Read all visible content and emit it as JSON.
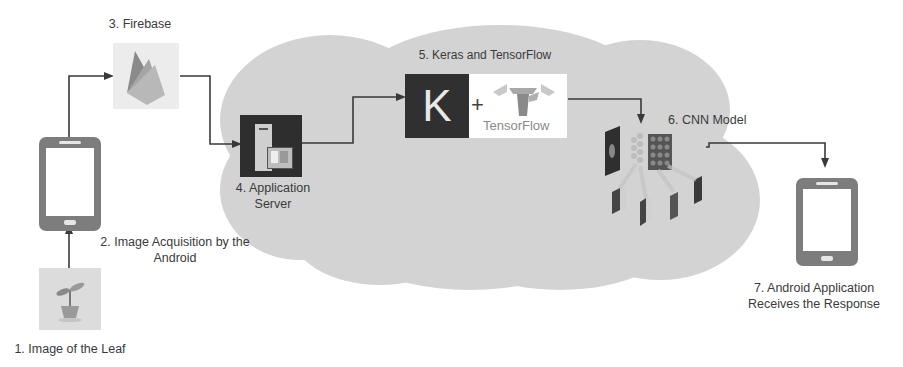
{
  "diagram": {
    "steps": [
      {
        "id": 1,
        "label": "1. Image of the Leaf",
        "icon": "leaf-plant-icon"
      },
      {
        "id": 2,
        "label_line1": "2. Image Acquisition by the",
        "label_line2": "Android",
        "icon": "smartphone-icon"
      },
      {
        "id": 3,
        "label": "3. Firebase",
        "icon": "firebase-icon"
      },
      {
        "id": 4,
        "label_line1": "4. Application",
        "label_line2": "Server",
        "icon": "server-icon"
      },
      {
        "id": 5,
        "label": "5. Keras and TensorFlow",
        "icon": "keras-tensorflow-icon",
        "keras_letter": "K",
        "plus": "+",
        "tensorflow_text": "TensorFlow"
      },
      {
        "id": 6,
        "label": "6. CNN Model",
        "icon": "cnn-model-icon"
      },
      {
        "id": 7,
        "label_line1": "7. Android Application",
        "label_line2": "Receives the Response",
        "icon": "smartphone-icon"
      }
    ],
    "flow": [
      "1->2",
      "2->3",
      "3->4",
      "4->5",
      "5->6",
      "6->7"
    ],
    "colors": {
      "cloud": "#d2d2d2",
      "arrow": "#3a3a3a",
      "phone": "#7a7a7a",
      "dark_box": "#2e2e2e"
    }
  }
}
